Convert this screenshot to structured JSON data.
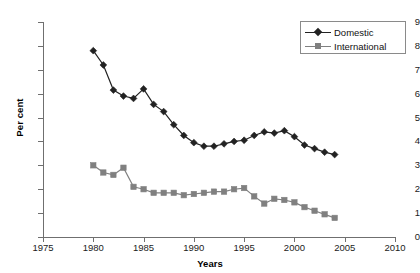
{
  "chart_data": {
    "type": "line",
    "title": "",
    "xlabel": "Years",
    "ylabel": "Per cent",
    "xlim": [
      1975,
      2010
    ],
    "ylim": [
      0,
      9
    ],
    "xticks": [
      1975,
      1980,
      1985,
      1990,
      1995,
      2000,
      2005,
      2010
    ],
    "yticks": [
      0,
      1,
      2,
      3,
      4,
      5,
      6,
      7,
      8,
      9
    ],
    "grid": false,
    "legend_position": "top-right",
    "x": [
      1980,
      1981,
      1982,
      1983,
      1984,
      1985,
      1986,
      1987,
      1988,
      1989,
      1990,
      1991,
      1992,
      1993,
      1994,
      1995,
      1996,
      1997,
      1998,
      1999,
      2000,
      2001,
      2002,
      2003,
      2004
    ],
    "series": [
      {
        "name": "Domestic",
        "color": "#222222",
        "marker": "diamond",
        "values": [
          7.8,
          7.2,
          6.15,
          5.9,
          5.8,
          6.2,
          5.55,
          5.25,
          4.7,
          4.25,
          3.95,
          3.8,
          3.8,
          3.9,
          4.0,
          4.05,
          4.25,
          4.4,
          4.35,
          4.45,
          4.2,
          3.85,
          3.7,
          3.55,
          3.45
        ]
      },
      {
        "name": "International",
        "color": "#808080",
        "marker": "square",
        "values": [
          3.0,
          2.7,
          2.6,
          2.9,
          2.1,
          2.0,
          1.85,
          1.85,
          1.85,
          1.75,
          1.8,
          1.85,
          1.9,
          1.9,
          2.0,
          2.05,
          1.7,
          1.4,
          1.6,
          1.55,
          1.45,
          1.25,
          1.1,
          0.95,
          0.8
        ]
      }
    ]
  },
  "axes": {
    "y_title": "Per cent",
    "x_title": "Years",
    "y_labels": [
      "9",
      "8",
      "7",
      "6",
      "5",
      "4",
      "3",
      "2",
      "1",
      "0"
    ],
    "x_labels": [
      "1975",
      "1980",
      "1985",
      "1990",
      "1995",
      "2000",
      "2005",
      "2010"
    ]
  },
  "legend": {
    "entries": [
      {
        "label": "Domestic",
        "color": "#222222",
        "marker": "diamond"
      },
      {
        "label": "International",
        "color": "#808080",
        "marker": "square"
      }
    ]
  }
}
